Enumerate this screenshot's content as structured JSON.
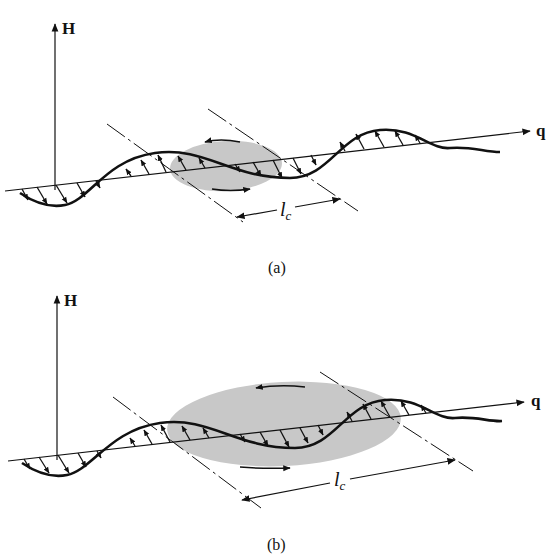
{
  "figure": {
    "panels": [
      {
        "id": "a",
        "caption": "(a)",
        "axis_vertical_label": "H",
        "axis_horizontal_label": "q",
        "length_label": "l",
        "length_label_subscript": "c",
        "description": "Spin wave along q with small shaded correlation region of length l_c"
      },
      {
        "id": "b",
        "caption": "(b)",
        "axis_vertical_label": "H",
        "axis_horizontal_label": "q",
        "length_label": "l",
        "length_label_subscript": "c",
        "description": "Spin wave along q with larger shaded correlation region of length l_c"
      }
    ],
    "colors": {
      "line": "#111111",
      "shade": "#c8c8c8",
      "background": "#ffffff"
    }
  }
}
